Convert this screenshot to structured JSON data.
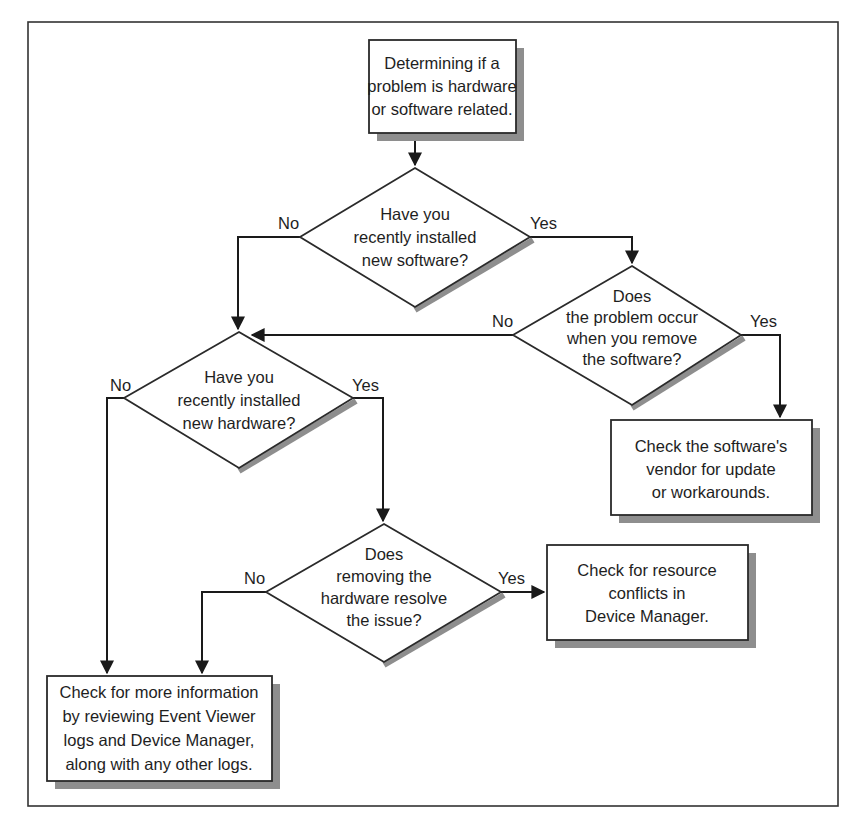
{
  "diagram": {
    "type": "flowchart",
    "colors": {
      "line": "#1a1a1a",
      "shadow": "#8e8e8e",
      "background": "#ffffff"
    },
    "nodes": {
      "start": {
        "shape": "rectangle",
        "lines": [
          "Determining if a",
          "problem is hardware",
          "or software related."
        ]
      },
      "q_new_software": {
        "shape": "diamond",
        "lines": [
          "Have you",
          "recently installed",
          "new software?"
        ]
      },
      "q_remove_software": {
        "shape": "diamond",
        "lines": [
          "Does",
          "the problem occur",
          "when you remove",
          "the software?"
        ]
      },
      "check_vendor": {
        "shape": "rectangle",
        "lines": [
          "Check the software's",
          "vendor for update",
          "or workarounds."
        ]
      },
      "q_new_hardware": {
        "shape": "diamond",
        "lines": [
          "Have you",
          "recently installed",
          "new hardware?"
        ]
      },
      "q_remove_hardware": {
        "shape": "diamond",
        "lines": [
          "Does",
          "removing the",
          "hardware resolve",
          "the issue?"
        ]
      },
      "check_resources": {
        "shape": "rectangle",
        "lines": [
          "Check for resource",
          "conflicts in",
          "Device Manager."
        ]
      },
      "check_logs": {
        "shape": "rectangle",
        "lines": [
          "Check for more information",
          "by reviewing Event Viewer",
          "logs and Device Manager,",
          "along with any other logs."
        ]
      }
    },
    "edges": [
      {
        "from": "start",
        "to": "q_new_software",
        "label": ""
      },
      {
        "from": "q_new_software",
        "to": "q_new_hardware",
        "label": "No"
      },
      {
        "from": "q_new_software",
        "to": "q_remove_software",
        "label": "Yes"
      },
      {
        "from": "q_remove_software",
        "to": "q_new_hardware",
        "label": "No"
      },
      {
        "from": "q_remove_software",
        "to": "check_vendor",
        "label": "Yes"
      },
      {
        "from": "q_new_hardware",
        "to": "check_logs",
        "label": "No"
      },
      {
        "from": "q_new_hardware",
        "to": "q_remove_hardware",
        "label": "Yes"
      },
      {
        "from": "q_remove_hardware",
        "to": "check_logs",
        "label": "No"
      },
      {
        "from": "q_remove_hardware",
        "to": "check_resources",
        "label": "Yes"
      }
    ]
  }
}
